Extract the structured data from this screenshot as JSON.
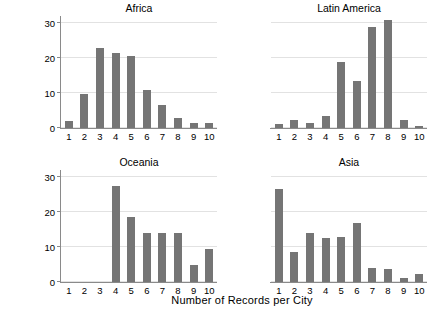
{
  "chart_data": {
    "type": "bar",
    "title": "",
    "xlabel": "Number of Records per City",
    "ylabel": "Frequency",
    "categories": [
      "1",
      "2",
      "3",
      "4",
      "5",
      "6",
      "7",
      "8",
      "9",
      "10"
    ],
    "ylim": [
      0,
      32
    ],
    "yticks": [
      0,
      10,
      20,
      30
    ],
    "ytick_labels": [
      "0",
      "10",
      "20",
      "30"
    ],
    "grid": true,
    "legend": "none",
    "layout": "2x2 facet grid",
    "bar_color": "#757575",
    "grid_color": "#e2e2e2",
    "axis_color": "#8a8a8a",
    "panels": [
      {
        "title": "Africa",
        "values": [
          2.0,
          9.7,
          23.0,
          21.5,
          20.5,
          11.0,
          6.5,
          3.0,
          1.5,
          1.5
        ]
      },
      {
        "title": "Latin America",
        "values": [
          1.2,
          2.2,
          1.5,
          3.5,
          19.0,
          13.5,
          29.0,
          31.0,
          2.2,
          0.5
        ]
      },
      {
        "title": "Oceania",
        "values": [
          0,
          0,
          0,
          27.5,
          18.5,
          14.0,
          14.0,
          14.0,
          5.0,
          9.3
        ]
      },
      {
        "title": "Asia",
        "values": [
          26.5,
          8.7,
          14.0,
          12.7,
          13.0,
          17.0,
          4.0,
          3.7,
          1.2,
          2.4
        ]
      }
    ]
  }
}
